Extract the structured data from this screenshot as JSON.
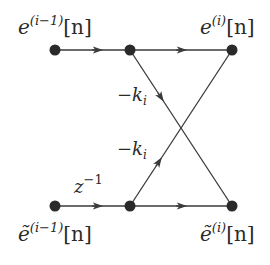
{
  "diagram": {
    "type": "lattice-filter-stage-signal-flow-graph",
    "colors": {
      "line": "#3a3a3a",
      "node": "#2a2a2a",
      "text": "#2a2a2a",
      "background": "#ffffff"
    },
    "nodes": [
      {
        "id": "in_top",
        "x": 55,
        "y": 50
      },
      {
        "id": "mid_top",
        "x": 130,
        "y": 50
      },
      {
        "id": "out_top",
        "x": 232,
        "y": 50
      },
      {
        "id": "in_bot",
        "x": 55,
        "y": 206
      },
      {
        "id": "mid_bot",
        "x": 130,
        "y": 206
      },
      {
        "id": "out_bot",
        "x": 232,
        "y": 206
      }
    ],
    "labels": {
      "in_top": {
        "base": "e",
        "sup": "(i−1)",
        "arg": "[n]"
      },
      "out_top": {
        "base": "e",
        "sup": "(i)",
        "arg": "[n]"
      },
      "in_bot": {
        "base": "ẽ",
        "sup": "(i−1)",
        "arg": "[n]"
      },
      "out_bot": {
        "base": "ẽ",
        "sup": "(i)",
        "arg": "[n]"
      },
      "delay": {
        "base": "z",
        "sup": "−1"
      },
      "gain_down": {
        "text": "−k",
        "sub": "i"
      },
      "gain_up": {
        "text": "−k",
        "sub": "i"
      }
    },
    "edges": [
      {
        "from": "in_top",
        "to": "mid_top",
        "label": ""
      },
      {
        "from": "mid_top",
        "to": "out_top",
        "label": ""
      },
      {
        "from": "mid_top",
        "to": "out_bot",
        "label": "−k_i"
      },
      {
        "from": "in_bot",
        "to": "mid_bot",
        "label": "z^-1"
      },
      {
        "from": "mid_bot",
        "to": "out_bot",
        "label": ""
      },
      {
        "from": "mid_bot",
        "to": "out_top",
        "label": "−k_i"
      }
    ]
  }
}
